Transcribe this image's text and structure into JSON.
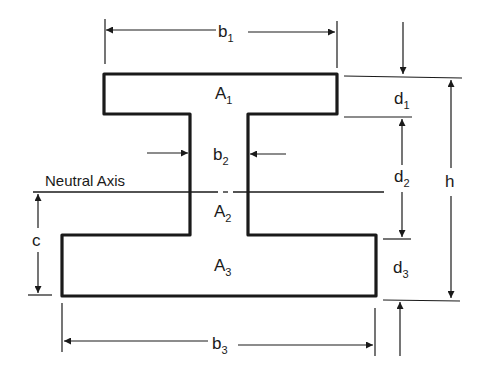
{
  "diagram": {
    "colors": {
      "stroke": "#1a1a1a",
      "background": "#ffffff"
    },
    "labels": {
      "b1": {
        "main": "b",
        "sub": "1"
      },
      "b2": {
        "main": "b",
        "sub": "2"
      },
      "b3": {
        "main": "b",
        "sub": "3"
      },
      "A1": {
        "main": "A",
        "sub": "1"
      },
      "A2": {
        "main": "A",
        "sub": "2"
      },
      "A3": {
        "main": "A",
        "sub": "3"
      },
      "d1": {
        "main": "d",
        "sub": "1"
      },
      "d2": {
        "main": "d",
        "sub": "2"
      },
      "d3": {
        "main": "d",
        "sub": "3"
      },
      "h": "h",
      "c": "c",
      "neutral_axis": "Neutral Axis"
    },
    "shapes": {
      "top_flange": {
        "area": "A1",
        "width": "b1",
        "depth": "d1"
      },
      "web": {
        "area": "A2",
        "width": "b2",
        "depth": "d2"
      },
      "bottom_flange": {
        "area": "A3",
        "width": "b3",
        "depth": "d3"
      },
      "total_height": "h",
      "neutral_axis_distance_from_bottom": "c"
    }
  }
}
